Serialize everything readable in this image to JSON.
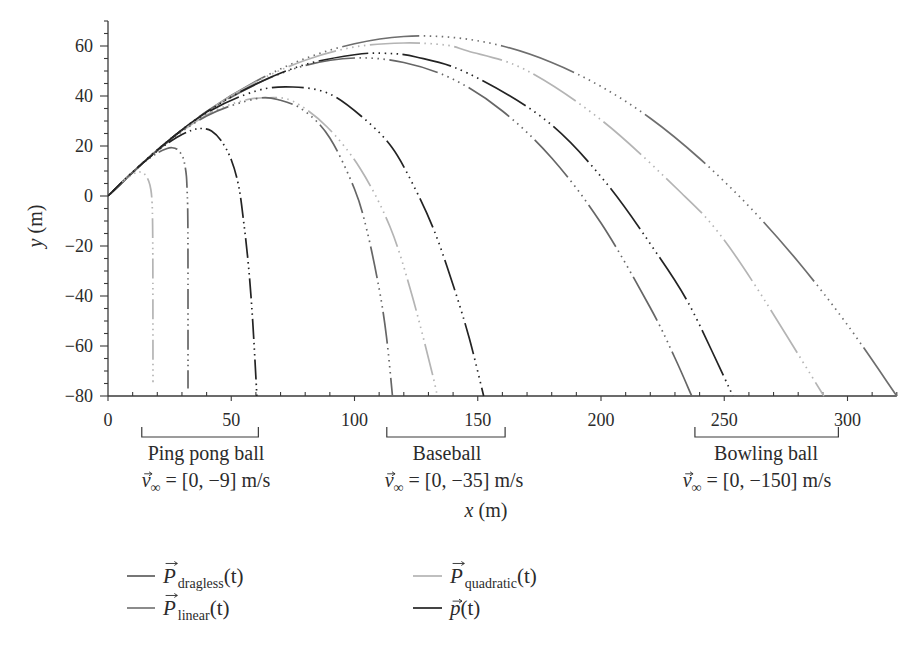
{
  "chart_data": {
    "type": "line",
    "title": "",
    "xlabel": "x (m)",
    "ylabel": "y (m)",
    "axis_labels": {
      "x": {
        "var": "x",
        "unit": "(m)"
      },
      "y": {
        "var": "y",
        "unit": "(m)"
      }
    },
    "xlim": [
      0,
      320
    ],
    "ylim": [
      -80,
      70
    ],
    "xticks": [
      0,
      50,
      100,
      150,
      200,
      250,
      300
    ],
    "xtick_labels": [
      "0",
      "50",
      "100",
      "150",
      "200",
      "250",
      "300"
    ],
    "yticks": [
      -80,
      -60,
      -40,
      -20,
      0,
      20,
      40,
      60
    ],
    "ytick_labels": [
      "−80",
      "−60",
      "−40",
      "−20",
      "0",
      "20",
      "40",
      "60"
    ],
    "x_minor_step": 10,
    "y_minor_step": 5,
    "grid": false,
    "legend_position": "bottom",
    "legend": [
      {
        "series": "dragless",
        "symbol": "P",
        "sub": "dragless",
        "arg": "(t)",
        "color": "#5e5e5e"
      },
      {
        "series": "quadratic",
        "symbol": "P",
        "sub": "quadratic",
        "arg": "(t)",
        "color": "#b4b4b4"
      },
      {
        "series": "linear",
        "symbol": "P",
        "sub": "linear",
        "arg": "(t)",
        "color": "#767676"
      },
      {
        "series": "p",
        "symbol": "p",
        "sub": "",
        "arg": "(t)",
        "color": "#232323"
      }
    ],
    "annotations": [
      {
        "ball": "Ping pong ball",
        "v_symbol": "v",
        "v_sub": "∞",
        "v_value": "= [0, −9] m/s",
        "bracket": [
          13.7,
          61.0
        ]
      },
      {
        "ball": "Baseball",
        "v_symbol": "v",
        "v_sub": "∞",
        "v_value": "= [0, −35] m/s",
        "bracket": [
          113.1,
          161.1
        ]
      },
      {
        "ball": "Bowling ball",
        "v_symbol": "v",
        "v_sub": "∞",
        "v_value": "= [0, −150] m/s",
        "bracket": [
          238.1,
          296.3
        ]
      }
    ],
    "series": [
      {
        "id": "dragless",
        "name": "P_dragless(t)",
        "model": "dragless",
        "ball": "all",
        "color": "#6e6e6e",
        "points": [
          [
            0,
            0
          ],
          [
            20,
            18.4
          ],
          [
            40,
            33.8
          ],
          [
            60,
            45.9
          ],
          [
            80,
            55
          ],
          [
            100,
            60.9
          ],
          [
            120,
            63.8
          ],
          [
            140,
            63.4
          ],
          [
            160,
            60
          ],
          [
            180,
            53.4
          ],
          [
            200,
            43.8
          ],
          [
            220,
            31.1
          ],
          [
            240,
            15
          ],
          [
            260,
            -4.1
          ],
          [
            280,
            -26.3
          ],
          [
            300,
            -51.6
          ],
          [
            320,
            -80
          ]
        ]
      },
      {
        "id": "bowling-quadratic",
        "name": "P_quadratic(t)",
        "model": "quadratic",
        "ball": "bowling",
        "color": "#b4b4b4",
        "points": [
          [
            0,
            0
          ],
          [
            20,
            18.4
          ],
          [
            40,
            33.7
          ],
          [
            60,
            45.6
          ],
          [
            80,
            54.3
          ],
          [
            100,
            59.6
          ],
          [
            120,
            61.2
          ],
          [
            136.7,
            60.4
          ],
          [
            146,
            58
          ],
          [
            169.5,
            50.4
          ],
          [
            201,
            29.7
          ],
          [
            232.7,
            1.1
          ],
          [
            246.8,
            -13.6
          ],
          [
            262.9,
            -36.3
          ],
          [
            290.4,
            -80
          ]
        ]
      },
      {
        "id": "bowling-linear",
        "name": "P_linear(t)",
        "model": "linear",
        "ball": "bowling",
        "color": "#666666",
        "points": [
          [
            0,
            0
          ],
          [
            20,
            18.4
          ],
          [
            40,
            33.4
          ],
          [
            60,
            44.7
          ],
          [
            80,
            52.2
          ],
          [
            100,
            55.2
          ],
          [
            120,
            53.4
          ],
          [
            140,
            46.7
          ],
          [
            160,
            34
          ],
          [
            180,
            15.2
          ],
          [
            200,
            -10.8
          ],
          [
            220,
            -44.7
          ],
          [
            230,
            -64.8
          ],
          [
            236.8,
            -80
          ]
        ]
      },
      {
        "id": "bowling-p",
        "name": "p(t)",
        "model": "p",
        "ball": "bowling",
        "color": "#232323",
        "points": [
          [
            0,
            0
          ],
          [
            20,
            18.4
          ],
          [
            40,
            33.6
          ],
          [
            60,
            44.8
          ],
          [
            80,
            52.6
          ],
          [
            100,
            56.5
          ],
          [
            112,
            57.1
          ],
          [
            125,
            55.6
          ],
          [
            146,
            49.1
          ],
          [
            177.5,
            30.4
          ],
          [
            201.7,
            5.7
          ],
          [
            224,
            -24.9
          ],
          [
            235,
            -42
          ],
          [
            244.8,
            -61.6
          ],
          [
            253.5,
            -80
          ]
        ]
      },
      {
        "id": "baseball-quadratic",
        "name": "P_quadratic(t)",
        "model": "quadratic",
        "ball": "baseball",
        "color": "#b4b4b4",
        "points": [
          [
            0,
            0
          ],
          [
            20,
            18.4
          ],
          [
            40,
            32.4
          ],
          [
            55,
            38.2
          ],
          [
            65,
            39.3
          ],
          [
            75,
            37.9
          ],
          [
            88.8,
            27.7
          ],
          [
            102.3,
            11
          ],
          [
            114.4,
            -12.3
          ],
          [
            123.1,
            -38.9
          ],
          [
            131.2,
            -69.6
          ],
          [
            133.6,
            -80
          ]
        ]
      },
      {
        "id": "baseball-linear",
        "name": "P_linear(t)",
        "model": "linear",
        "ball": "baseball",
        "color": "#666666",
        "points": [
          [
            0,
            0
          ],
          [
            20,
            18.2
          ],
          [
            40,
            32
          ],
          [
            60,
            38.9
          ],
          [
            70,
            38.3
          ],
          [
            80,
            33.8
          ],
          [
            90,
            23.2
          ],
          [
            100,
            2.8
          ],
          [
            105,
            -13.6
          ],
          [
            110,
            -37.1
          ],
          [
            113,
            -56.5
          ],
          [
            115.4,
            -80
          ]
        ]
      },
      {
        "id": "baseball-p",
        "name": "p(t)",
        "model": "p",
        "ball": "baseball",
        "color": "#232323",
        "points": [
          [
            0,
            0
          ],
          [
            20,
            18.4
          ],
          [
            40,
            33.2
          ],
          [
            60,
            42
          ],
          [
            75,
            43.6
          ],
          [
            89.5,
            41
          ],
          [
            103,
            31.7
          ],
          [
            115,
            19.7
          ],
          [
            124.5,
            3.1
          ],
          [
            132.5,
            -14.3
          ],
          [
            140,
            -35.6
          ],
          [
            146.6,
            -57
          ],
          [
            152.4,
            -80
          ]
        ]
      },
      {
        "id": "pingpong-quadratic",
        "name": "P_quadratic(t)",
        "model": "quadratic",
        "ball": "pingpong",
        "color": "#b4b4b4",
        "points": [
          [
            0,
            0
          ],
          [
            4,
            3.9
          ],
          [
            8,
            7.4
          ],
          [
            11,
            9.2
          ],
          [
            13,
            9.6
          ],
          [
            15,
            8.6
          ],
          [
            16.5,
            6
          ],
          [
            17.4,
            2.5
          ],
          [
            17.9,
            -3
          ],
          [
            18.1,
            -12
          ],
          [
            18.2,
            -30
          ],
          [
            18.25,
            -74.5
          ]
        ]
      },
      {
        "id": "pingpong-linear",
        "name": "P_linear(t)",
        "model": "linear",
        "ball": "pingpong",
        "color": "#666666",
        "points": [
          [
            0,
            0
          ],
          [
            5,
            4.9
          ],
          [
            10,
            9.5
          ],
          [
            15,
            13.7
          ],
          [
            20,
            17.2
          ],
          [
            24,
            19
          ],
          [
            26,
            19.3
          ],
          [
            28,
            18.7
          ],
          [
            30,
            16.3
          ],
          [
            31,
            13.3
          ],
          [
            31.8,
            8
          ],
          [
            32.1,
            2
          ],
          [
            32.3,
            -3.4
          ],
          [
            32.4,
            -11.4
          ],
          [
            32.45,
            -30
          ],
          [
            32.46,
            -77
          ]
        ]
      },
      {
        "id": "pingpong-p",
        "name": "p(t)",
        "model": "p",
        "ball": "pingpong",
        "color": "#232323",
        "points": [
          [
            0,
            0
          ],
          [
            10,
            9.6
          ],
          [
            20,
            18
          ],
          [
            28,
            23.5
          ],
          [
            34,
            26.3
          ],
          [
            38,
            27
          ],
          [
            42,
            26
          ],
          [
            46,
            22
          ],
          [
            50,
            14.5
          ],
          [
            53,
            4
          ],
          [
            55,
            -10
          ],
          [
            57,
            -28
          ],
          [
            58.7,
            -50
          ],
          [
            60.4,
            -80
          ]
        ]
      }
    ]
  }
}
